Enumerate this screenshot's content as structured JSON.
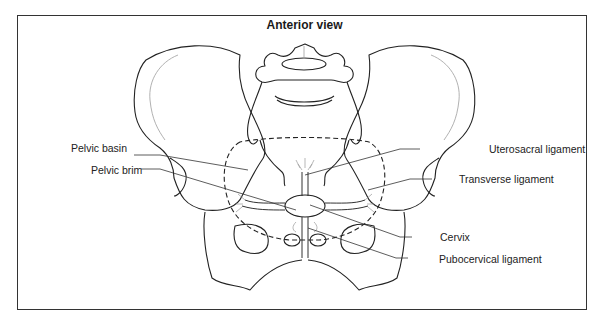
{
  "figure": {
    "title": "Anterior view",
    "labels": {
      "pelvic_basin": "Pelvic basin",
      "pelvic_brim": "Pelvic brim",
      "uterosacral_ligament": "Uterosacral ligament",
      "transverse_ligament": "Transverse ligament",
      "cervix": "Cervix",
      "pubocervical_ligament": "Pubocervical ligament"
    },
    "colors": {
      "line": "#222222",
      "light_line": "#a8a8a8",
      "frame": "#333333",
      "background": "#ffffff"
    }
  }
}
